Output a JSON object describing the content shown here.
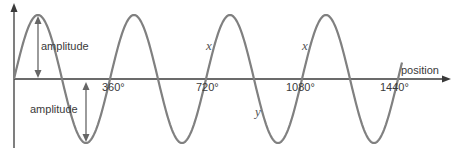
{
  "diagram": {
    "type": "sine wave",
    "x_axis_label": "position",
    "tick_labels": [
      "360°",
      "720°",
      "1080°",
      "1440°"
    ],
    "amplitude_labels": [
      "amplitude",
      "amplitude"
    ],
    "point_labels": {
      "x1": "x",
      "x2": "x",
      "y": "y"
    },
    "colors": {
      "wave": "#808080",
      "axis": "#3a3a3a",
      "arrow": "#666666"
    }
  }
}
